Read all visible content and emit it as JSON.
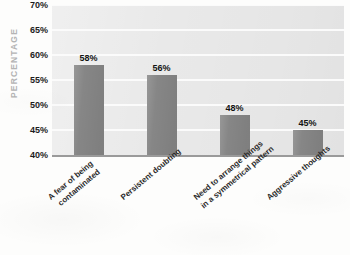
{
  "chart_data": {
    "type": "bar",
    "title": "",
    "xlabel": "",
    "ylabel": "PERCENTAGE",
    "ylim": [
      40,
      70
    ],
    "ytick_step": 5,
    "grid": true,
    "legend": "none",
    "bar_color": "#868686",
    "plot_background": "#e9e9e9",
    "gridline_color": "#fbfbfb",
    "value_label_color": "#131313",
    "axis_title_color": "#b4b4b4",
    "categories": [
      "A fear of being contaminated",
      "Persistent doubting",
      "Need to arrange things in a symmetrical pattern",
      "Aggressive thoughts"
    ],
    "category_lines": [
      [
        "A fear of being",
        "contaminated"
      ],
      [
        "Persistent doubting"
      ],
      [
        "Need to arrange things",
        "in a symmetrical pattern"
      ],
      [
        "Aggressive thoughts"
      ]
    ],
    "values": [
      58,
      56,
      48,
      45
    ],
    "value_labels": [
      "58%",
      "56%",
      "48%",
      "45%"
    ],
    "ytick_labels": [
      "70%",
      "65%",
      "60%",
      "55%",
      "50%",
      "45%",
      "40%"
    ],
    "ytick_values": [
      70,
      65,
      60,
      55,
      50,
      45,
      40
    ]
  }
}
